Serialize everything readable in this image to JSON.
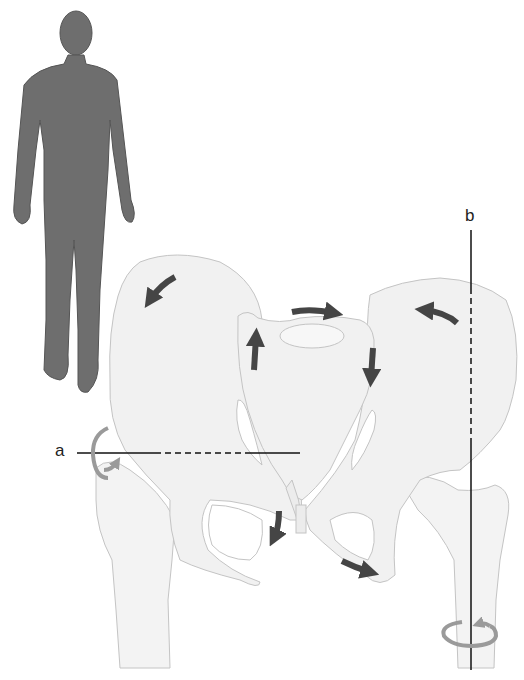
{
  "figure": {
    "axis_labels": {
      "a": "a",
      "b": "b"
    },
    "colors": {
      "bone_fill": "#f1f1f1",
      "bone_outline": "#c4c4c4",
      "body_silhouette": "#6e6e6e",
      "dark_arrow": "#454545",
      "rotation_arrow": "#9a9a9a",
      "axis_line": "#111111"
    },
    "elements": {
      "human_silhouette": "standing human figure, front view",
      "axis_a": "horizontal axis, solid then dashed through the pelvis, with a rotation arrow at its left end",
      "axis_b": "vertical axis through the right femur, with a rotation arrow at the lower shaft",
      "motion_arrows": [
        "left iliac wing counter-rotation",
        "sacral base top rightward",
        "sacrum left side upward",
        "sacrum right side downward",
        "right iliac wing curved leftward",
        "left pubic ramus downward",
        "right ischiopubic ramus rightward"
      ]
    }
  }
}
